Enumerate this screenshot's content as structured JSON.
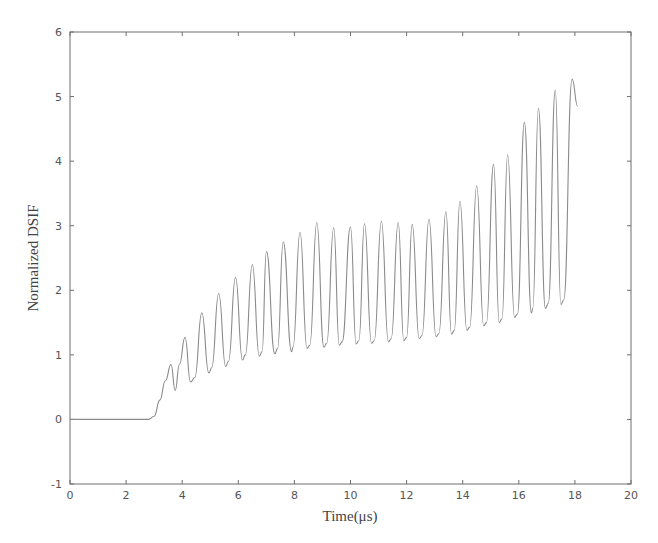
{
  "chart_data": {
    "type": "line",
    "title": "",
    "xlabel": "Time(μs)",
    "ylabel": "Normalized DSIF",
    "xlim": [
      0,
      20
    ],
    "ylim": [
      -1,
      6
    ],
    "xticks": [
      0,
      2,
      4,
      6,
      8,
      10,
      12,
      14,
      16,
      18,
      20
    ],
    "yticks": [
      -1,
      0,
      1,
      2,
      3,
      4,
      5,
      6
    ],
    "grid": false,
    "legend": null,
    "line_color": "#8a8a8a",
    "series": [
      {
        "name": "Normalized DSIF",
        "x": [
          0,
          2.8,
          3.0,
          3.2,
          3.4,
          3.6,
          3.75,
          3.9,
          4.1,
          4.3,
          4.45,
          4.7,
          4.95,
          5.05,
          5.3,
          5.55,
          5.65,
          5.9,
          6.15,
          6.25,
          6.5,
          6.75,
          6.85,
          7.0,
          7.3,
          7.4,
          7.6,
          7.9,
          7.95,
          8.2,
          8.45,
          8.55,
          8.8,
          9.05,
          9.15,
          9.4,
          9.6,
          9.7,
          10.0,
          10.2,
          10.3,
          10.5,
          10.75,
          10.85,
          11.1,
          11.35,
          11.45,
          11.7,
          11.9,
          12.0,
          12.2,
          12.45,
          12.55,
          12.8,
          13.05,
          13.15,
          13.4,
          13.6,
          13.7,
          13.9,
          14.15,
          14.25,
          14.5,
          14.75,
          14.85,
          15.1,
          15.3,
          15.4,
          15.6,
          15.85,
          15.95,
          16.2,
          16.45,
          16.5,
          16.7,
          16.95,
          17.05,
          17.3,
          17.5,
          17.6,
          17.9,
          18.1
        ],
        "y": [
          0,
          0,
          0.05,
          0.3,
          0.6,
          0.85,
          0.45,
          0.85,
          1.27,
          0.58,
          0.65,
          1.65,
          0.72,
          0.8,
          1.95,
          0.82,
          0.9,
          2.2,
          0.92,
          1.0,
          2.4,
          0.98,
          1.05,
          2.6,
          1.02,
          1.1,
          2.75,
          1.05,
          1.12,
          2.9,
          1.1,
          1.15,
          3.05,
          1.12,
          1.18,
          2.97,
          1.15,
          1.2,
          2.98,
          1.17,
          1.22,
          3.03,
          1.18,
          1.22,
          3.07,
          1.2,
          1.25,
          3.05,
          1.22,
          1.27,
          3.02,
          1.25,
          1.3,
          3.1,
          1.28,
          1.33,
          3.22,
          1.32,
          1.38,
          3.38,
          1.38,
          1.43,
          3.62,
          1.45,
          1.5,
          3.95,
          1.5,
          1.56,
          4.1,
          1.58,
          1.63,
          4.6,
          1.65,
          1.72,
          4.82,
          1.72,
          1.8,
          5.1,
          1.78,
          1.85,
          5.27,
          4.85
        ]
      }
    ]
  }
}
